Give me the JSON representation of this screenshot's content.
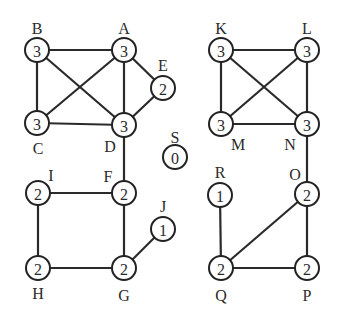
{
  "diagram": {
    "type": "undirected-graph",
    "nodes": [
      {
        "id": "A",
        "degree": "3",
        "x": 124,
        "y": 50,
        "lx": 124,
        "ly": 28
      },
      {
        "id": "B",
        "degree": "3",
        "x": 37,
        "y": 50,
        "lx": 37,
        "ly": 28
      },
      {
        "id": "C",
        "degree": "3",
        "x": 37,
        "y": 123,
        "lx": 38,
        "ly": 148
      },
      {
        "id": "D",
        "degree": "3",
        "x": 124,
        "y": 125,
        "lx": 110,
        "ly": 146
      },
      {
        "id": "E",
        "degree": "2",
        "x": 163,
        "y": 88,
        "lx": 163,
        "ly": 65
      },
      {
        "id": "F",
        "degree": "2",
        "x": 124,
        "y": 193,
        "lx": 108,
        "ly": 176
      },
      {
        "id": "G",
        "degree": "2",
        "x": 124,
        "y": 268,
        "lx": 124,
        "ly": 295
      },
      {
        "id": "H",
        "degree": "2",
        "x": 38,
        "y": 268,
        "lx": 38,
        "ly": 293
      },
      {
        "id": "I",
        "degree": "2",
        "x": 38,
        "y": 193,
        "lx": 51,
        "ly": 175
      },
      {
        "id": "J",
        "degree": "1",
        "x": 163,
        "y": 229,
        "lx": 163,
        "ly": 206
      },
      {
        "id": "K",
        "degree": "3",
        "x": 221,
        "y": 50,
        "lx": 221,
        "ly": 28
      },
      {
        "id": "L",
        "degree": "3",
        "x": 307,
        "y": 50,
        "lx": 307,
        "ly": 28
      },
      {
        "id": "M",
        "degree": "3",
        "x": 221,
        "y": 124,
        "lx": 238,
        "ly": 144
      },
      {
        "id": "N",
        "degree": "3",
        "x": 307,
        "y": 124,
        "lx": 290,
        "ly": 144
      },
      {
        "id": "O",
        "degree": "2",
        "x": 307,
        "y": 194,
        "lx": 295,
        "ly": 174
      },
      {
        "id": "P",
        "degree": "2",
        "x": 307,
        "y": 268,
        "lx": 307,
        "ly": 295
      },
      {
        "id": "Q",
        "degree": "2",
        "x": 221,
        "y": 268,
        "lx": 221,
        "ly": 295
      },
      {
        "id": "R",
        "degree": "1",
        "x": 220,
        "y": 195,
        "lx": 220,
        "ly": 172
      },
      {
        "id": "S",
        "degree": "0",
        "x": 175,
        "y": 157,
        "lx": 175,
        "ly": 137
      }
    ],
    "edges": [
      [
        "B",
        "A"
      ],
      [
        "B",
        "C"
      ],
      [
        "B",
        "D"
      ],
      [
        "A",
        "C"
      ],
      [
        "A",
        "D"
      ],
      [
        "A",
        "E"
      ],
      [
        "C",
        "D"
      ],
      [
        "D",
        "E"
      ],
      [
        "D",
        "F"
      ],
      [
        "I",
        "F"
      ],
      [
        "I",
        "H"
      ],
      [
        "F",
        "G"
      ],
      [
        "H",
        "G"
      ],
      [
        "G",
        "J"
      ],
      [
        "K",
        "L"
      ],
      [
        "K",
        "M"
      ],
      [
        "K",
        "N"
      ],
      [
        "L",
        "M"
      ],
      [
        "L",
        "N"
      ],
      [
        "M",
        "N"
      ],
      [
        "N",
        "O"
      ],
      [
        "O",
        "Q"
      ],
      [
        "O",
        "P"
      ],
      [
        "R",
        "Q"
      ],
      [
        "Q",
        "P"
      ]
    ],
    "node_radius": 12
  }
}
